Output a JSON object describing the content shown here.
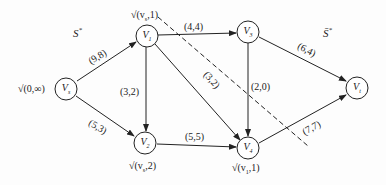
{
  "diagram": {
    "type": "network-flow",
    "sets": {
      "source_side": "S*",
      "sink_side": "S̄*"
    },
    "nodes": [
      {
        "id": "vs",
        "label": "V",
        "sub": "s",
        "mark": "√(0,∞)"
      },
      {
        "id": "v1",
        "label": "V",
        "sub": "1",
        "mark": "√(vs,1)"
      },
      {
        "id": "v2",
        "label": "V",
        "sub": "2",
        "mark": "√(vs,2)"
      },
      {
        "id": "v3",
        "label": "V",
        "sub": "3",
        "mark": ""
      },
      {
        "id": "v4",
        "label": "V",
        "sub": "4",
        "mark": "√(v1,1)"
      },
      {
        "id": "vt",
        "label": "V",
        "sub": "t",
        "mark": ""
      }
    ],
    "edges": [
      {
        "from": "vs",
        "to": "v1",
        "label": "(9,8)"
      },
      {
        "from": "vs",
        "to": "v2",
        "label": "(5,3)"
      },
      {
        "from": "v1",
        "to": "v3",
        "label": "(4,4)"
      },
      {
        "from": "v1",
        "to": "v2",
        "label": "(3,2)"
      },
      {
        "from": "v1",
        "to": "v4",
        "label": "(3,2)"
      },
      {
        "from": "v2",
        "to": "v4",
        "label": "(5,5)"
      },
      {
        "from": "v3",
        "to": "v4",
        "label": "(2,0)"
      },
      {
        "from": "v3",
        "to": "vt",
        "label": "(6,4)"
      },
      {
        "from": "v4",
        "to": "vt",
        "label": "(7,7)"
      }
    ],
    "cut_line": "dashed"
  },
  "text": {
    "S": "S",
    "Sstar": "*",
    "Sbar": "S̄",
    "Sbarstar": "*",
    "mark_vs": "√(0,∞)",
    "mark_v1": "√(v",
    "mark_v1_sub": "s",
    "mark_v1_end": ",1)",
    "mark_v2": "√(v",
    "mark_v2_sub": "s",
    "mark_v2_end": ",2)",
    "mark_v4": "√(v",
    "mark_v4_sub": "1",
    "mark_v4_end": ",1)",
    "e_s1": "(9,8)",
    "e_s2": "(5,3)",
    "e_13": "(4,4)",
    "e_12": "(3,2)",
    "e_14": "(3,2)",
    "e_24": "(5,5)",
    "e_34": "(2,0)",
    "e_3t": "(6,4)",
    "e_4t": "(7,7)",
    "V": "V",
    "sub_s": "s",
    "sub_1": "1",
    "sub_2": "2",
    "sub_3": "3",
    "sub_4": "4",
    "sub_t": "t"
  }
}
